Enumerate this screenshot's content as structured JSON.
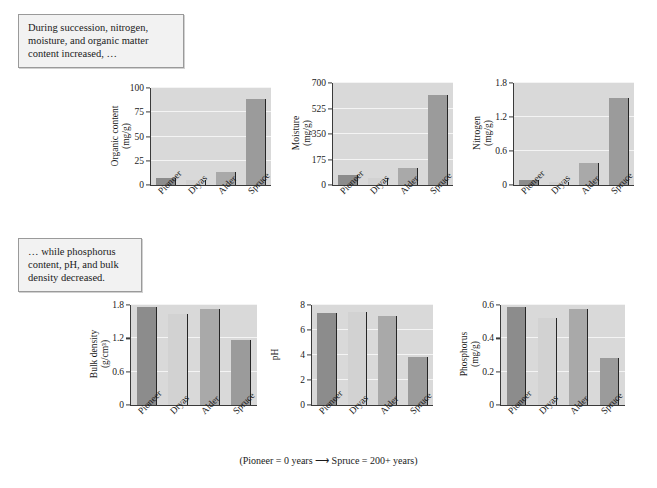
{
  "callouts": {
    "top": "During succession, nitrogen, moisture, and organic matter content increased, …",
    "bottom": "… while phosphorus content, pH, and bulk density decreased."
  },
  "caption": "(Pioneer = 0 years ⟶ Spruce = 200+ years)",
  "bar_colors": {
    "Pioneer": "#8c8c8c",
    "Dryas": "#d2d2d2",
    "Alder": "#a9a9a9",
    "Spruce": "#9b9b9b"
  },
  "plot_background": "#d9d9d9",
  "chart_data": [
    {
      "type": "bar",
      "id": "organic-content",
      "title": "",
      "ylabel": "Organic content (mg/g)",
      "ylabel_line1": "Organic content",
      "ylabel_line2": "(mg/g)",
      "xlabel": "",
      "categories": [
        "Pioneer",
        "Dryas",
        "Alder",
        "Spruce"
      ],
      "values": [
        7,
        5,
        13,
        89
      ],
      "ylim": [
        0,
        100
      ],
      "yticks": [
        0,
        25,
        50,
        75,
        100
      ],
      "ytick_labels": [
        "0",
        "25",
        "50",
        "75",
        "100"
      ],
      "grid": true
    },
    {
      "type": "bar",
      "id": "moisture",
      "title": "",
      "ylabel": "Moisture (mg/g)",
      "ylabel_line1": "Moisture",
      "ylabel_line2": "(mg/g)",
      "xlabel": "",
      "categories": [
        "Pioneer",
        "Dryas",
        "Alder",
        "Spruce"
      ],
      "values": [
        70,
        50,
        115,
        615
      ],
      "ylim": [
        0,
        700
      ],
      "yticks": [
        0,
        175,
        350,
        525,
        700
      ],
      "ytick_labels": [
        "0",
        "175",
        "350",
        "525",
        "700"
      ],
      "grid": true
    },
    {
      "type": "bar",
      "id": "nitrogen",
      "title": "",
      "ylabel": "Nitrogen (mg/g)",
      "ylabel_line1": "Nitrogen",
      "ylabel_line2": "(mg/g)",
      "xlabel": "",
      "categories": [
        "Pioneer",
        "Dryas",
        "Alder",
        "Spruce"
      ],
      "values": [
        0.08,
        0.06,
        0.38,
        1.53
      ],
      "ylim": [
        0,
        1.8
      ],
      "yticks": [
        0,
        0.6,
        1.2,
        1.8
      ],
      "ytick_labels": [
        "0",
        "0.6",
        "1.2",
        "1.8"
      ],
      "grid": true
    },
    {
      "type": "bar",
      "id": "bulk-density",
      "title": "",
      "ylabel": "Bulk density (g/cm3)",
      "ylabel_line1": "Bulk density",
      "ylabel_line2": "(g/cm³)",
      "xlabel": "",
      "categories": [
        "Pioneer",
        "Dryas",
        "Alder",
        "Spruce"
      ],
      "values": [
        1.77,
        1.63,
        1.72,
        1.17
      ],
      "ylim": [
        0,
        1.8
      ],
      "yticks": [
        0,
        0.6,
        1.2,
        1.8
      ],
      "ytick_labels": [
        "0",
        "0.6",
        "1.2",
        "1.8"
      ],
      "grid": true
    },
    {
      "type": "bar",
      "id": "ph",
      "title": "",
      "ylabel": "pH",
      "ylabel_line1": "pH",
      "ylabel_line2": "",
      "xlabel": "",
      "categories": [
        "Pioneer",
        "Dryas",
        "Alder",
        "Spruce"
      ],
      "values": [
        7.4,
        7.45,
        7.1,
        3.85
      ],
      "ylim": [
        0,
        8
      ],
      "yticks": [
        0,
        2,
        4,
        6,
        8
      ],
      "ytick_labels": [
        "0",
        "2",
        "4",
        "6",
        "8"
      ],
      "grid": true
    },
    {
      "type": "bar",
      "id": "phosphorus",
      "title": "",
      "ylabel": "Phosphorus (mg/g)",
      "ylabel_line1": "Phosphorus",
      "ylabel_line2": "(mg/g)",
      "xlabel": "",
      "categories": [
        "Pioneer",
        "Dryas",
        "Alder",
        "Spruce"
      ],
      "values": [
        0.59,
        0.52,
        0.575,
        0.285
      ],
      "ylim": [
        0,
        0.6
      ],
      "yticks": [
        0,
        0.2,
        0.4,
        0.6
      ],
      "ytick_labels": [
        "0",
        "0.2",
        "0.4",
        "0.6"
      ],
      "grid": true
    }
  ]
}
